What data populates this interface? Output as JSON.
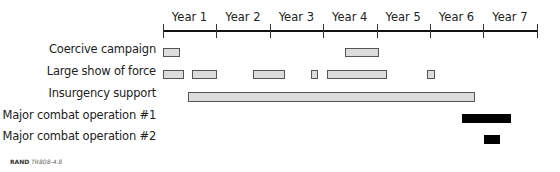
{
  "chart_data": {
    "type": "gantt",
    "title": "",
    "x_axis": {
      "categories": [
        "Year 1",
        "Year 2",
        "Year 3",
        "Year 4",
        "Year 5",
        "Year 6",
        "Year 7"
      ],
      "px_start": 163,
      "px_per_year": 53.4
    },
    "rows": [
      {
        "label": "Coercive campaign",
        "color": "#dcdcdc",
        "intervals": [
          [
            0.0,
            0.32
          ],
          [
            3.4,
            4.03
          ]
        ]
      },
      {
        "label": "Large show of force",
        "color": "#dcdcdc",
        "intervals": [
          [
            0.0,
            0.4
          ],
          [
            0.55,
            1.01
          ],
          [
            1.69,
            2.29
          ],
          [
            2.78,
            2.92
          ],
          [
            3.08,
            4.2
          ],
          [
            4.95,
            5.1
          ]
        ]
      },
      {
        "label": "Insurgency support",
        "color": "#dcdcdc",
        "intervals": [
          [
            0.47,
            5.84
          ]
        ]
      },
      {
        "label": "Major combat operation #1",
        "color": "#000000",
        "intervals": [
          [
            5.6,
            6.52
          ]
        ]
      },
      {
        "label": "Major combat operation #2",
        "color": "#000000",
        "intervals": [
          [
            6.01,
            6.31
          ]
        ]
      }
    ],
    "grid": false,
    "legend": null
  },
  "source": {
    "org": "RAND",
    "id": "TR808-4.8"
  }
}
